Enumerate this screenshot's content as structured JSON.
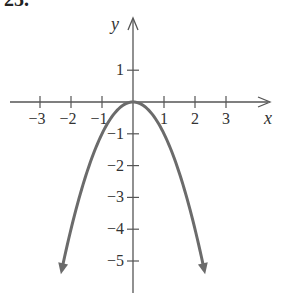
{
  "problem_number": "25.",
  "chart_data": {
    "type": "line",
    "title": "",
    "function": "y = -x^2",
    "xlabel": "x",
    "ylabel": "y",
    "xlim": [
      -3.3,
      4.3
    ],
    "ylim": [
      -6,
      2
    ],
    "grid": false,
    "x_ticks": [
      -3,
      -2,
      -1,
      1,
      2,
      3
    ],
    "x_tick_labels": [
      "−3",
      "−2",
      "−1",
      "1",
      "2",
      "3"
    ],
    "y_ticks": [
      1,
      -1,
      -2,
      -3,
      -4,
      -5
    ],
    "y_tick_labels": [
      "1",
      "−1",
      "−2",
      "−3",
      "−4",
      "−5"
    ],
    "series": [
      {
        "name": "parabola",
        "color": "#6b6b6b",
        "x": [
          -2.3,
          -2,
          -1.5,
          -1,
          -0.5,
          0,
          0.5,
          1,
          1.5,
          2,
          2.3
        ],
        "y": [
          -5.29,
          -4,
          -2.25,
          -1,
          -0.25,
          0,
          -0.25,
          -1,
          -2.25,
          -4,
          -5.29
        ],
        "arrows_at_ends": true
      }
    ],
    "vertex": [
      0,
      0
    ]
  },
  "colors": {
    "axis": "#555555",
    "curve": "#6b6b6b",
    "text": "#333333"
  }
}
